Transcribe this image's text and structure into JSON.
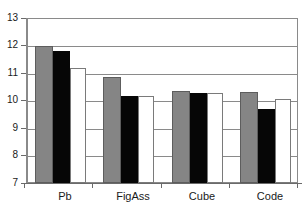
{
  "chart_data": {
    "type": "bar",
    "title": "",
    "subtitle": "",
    "xlabel": "",
    "ylabel": "",
    "categories": [
      "Pb",
      "FigAss",
      "Cube",
      "Code"
    ],
    "series": [
      {
        "name": "series-1-gray",
        "color": "#858585",
        "values": [
          12.0,
          10.85,
          10.35,
          10.3
        ]
      },
      {
        "name": "series-2-black",
        "color": "#060606",
        "values": [
          11.8,
          10.15,
          10.28,
          9.7
        ]
      },
      {
        "name": "series-3-white",
        "color": "#ffffff",
        "values": [
          11.2,
          10.15,
          10.28,
          10.05
        ]
      }
    ],
    "ylim": [
      7,
      13
    ],
    "yticks": [
      7,
      8,
      9,
      10,
      11,
      12,
      13
    ],
    "ytick_labels": [
      "7",
      "8",
      "9",
      "10",
      "11",
      "12",
      "13"
    ],
    "grid": true,
    "grid_axis": "y",
    "legend": false,
    "legend_position": "none",
    "annotations": []
  },
  "axis": {
    "y_tick_0": "7",
    "y_tick_1": "8",
    "y_tick_2": "9",
    "y_tick_3": "10",
    "y_tick_4": "11",
    "y_tick_5": "12",
    "y_tick_6": "13",
    "x_tick_0": "Pb",
    "x_tick_1": "FigAss",
    "x_tick_2": "Cube",
    "x_tick_3": "Code"
  },
  "colors": {
    "series_gray": "#858585",
    "series_black": "#060606",
    "series_white": "#ffffff",
    "grid": "#8a8a8a",
    "axis": "#6a6a6a",
    "text": "#1a1a1a",
    "background": "#ffffff"
  }
}
